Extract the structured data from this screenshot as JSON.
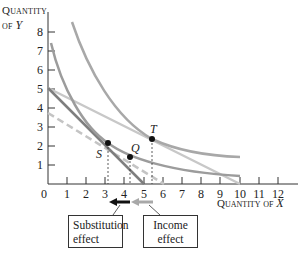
{
  "axes": {
    "y_label_line1": "Quantity",
    "y_label_line2_prefix": "of ",
    "y_label_var": "Y",
    "x_label_prefix": "Quantity of ",
    "x_label_var": "X",
    "origin_label": "0",
    "x_ticks": [
      "1",
      "2",
      "3",
      "4",
      "5",
      "6",
      "7",
      "8",
      "9",
      "10",
      "11",
      "12"
    ],
    "y_ticks": [
      "1",
      "2",
      "3",
      "4",
      "5",
      "6",
      "7",
      "8"
    ]
  },
  "points": {
    "S": {
      "label": "S",
      "x": 3.1,
      "y": 2.1
    },
    "Q": {
      "label": "Q",
      "x": 4.3,
      "y": 1.4
    },
    "T": {
      "label": "T",
      "x": 5.5,
      "y": 2.4
    }
  },
  "boxes": {
    "substitution_line1": "Substitution",
    "substitution_line2": "effect",
    "income_line1": "Income",
    "income_line2": "effect"
  },
  "colors": {
    "axis": "#333333",
    "budget_original": "#c8c8c8",
    "budget_new": "#7a7a7a",
    "budget_dashed": "#c0c0c0",
    "indifference": "#a0a0a0",
    "substitution_arrow": "#111111",
    "income_arrow": "#a8a8a8"
  }
}
